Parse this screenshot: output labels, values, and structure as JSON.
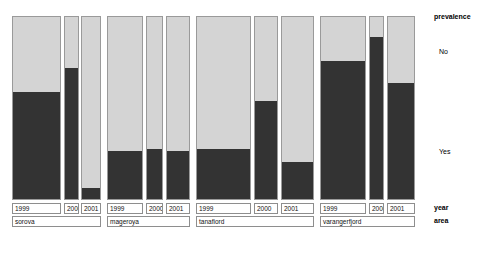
{
  "chart_data": {
    "type": "bar",
    "subtype": "stacked-mosaic",
    "title": "",
    "xlabel": "",
    "ylabel": "",
    "grid": false,
    "legend": {
      "title": "prevalence",
      "position": "right",
      "entries": [
        {
          "label": "No",
          "color": "#d4d4d4"
        },
        {
          "label": "Yes",
          "color": "#333333"
        }
      ]
    },
    "axes": [
      {
        "name": "year",
        "label": "year"
      },
      {
        "name": "area",
        "label": "area"
      }
    ],
    "categories": [
      {
        "area": "sorova",
        "year": "1999"
      },
      {
        "area": "sorova",
        "year": "2000"
      },
      {
        "area": "sorova",
        "year": "2001"
      },
      {
        "area": "mageroya",
        "year": "1999"
      },
      {
        "area": "mageroya",
        "year": "2000"
      },
      {
        "area": "mageroya",
        "year": "2001"
      },
      {
        "area": "tanafiord",
        "year": "1999"
      },
      {
        "area": "tanafiord",
        "year": "2000"
      },
      {
        "area": "tanafiord",
        "year": "2001"
      },
      {
        "area": "varangerfjord",
        "year": "1999"
      },
      {
        "area": "varangerfjord",
        "year": "2000"
      },
      {
        "area": "varangerfjord",
        "year": "2001"
      }
    ],
    "series": [
      {
        "name": "No",
        "values": [
          42,
          29,
          94,
          74,
          73,
          74,
          73,
          47,
          80,
          25,
          12,
          37
        ]
      },
      {
        "name": "Yes",
        "values": [
          58,
          71,
          6,
          26,
          27,
          26,
          27,
          53,
          20,
          75,
          88,
          63
        ]
      }
    ],
    "ylim": [
      0,
      100
    ],
    "units": "percent"
  },
  "plot": {
    "bars": [
      {
        "id": "sorova-1999",
        "x": 12,
        "w": 49,
        "yes_pct": 58,
        "area": "sorova",
        "year": "1999"
      },
      {
        "id": "sorova-2000",
        "x": 64,
        "w": 15,
        "yes_pct": 71,
        "area": "sorova",
        "year": "2000"
      },
      {
        "id": "sorova-2001",
        "x": 81,
        "w": 20,
        "yes_pct": 6,
        "area": "sorova",
        "year": "2001"
      },
      {
        "id": "mageroya-1999",
        "x": 107,
        "w": 36,
        "yes_pct": 26,
        "area": "mageroya",
        "year": "1999"
      },
      {
        "id": "mageroya-2000",
        "x": 146,
        "w": 17,
        "yes_pct": 27,
        "area": "mageroya",
        "year": "2000"
      },
      {
        "id": "mageroya-2001",
        "x": 166,
        "w": 24,
        "yes_pct": 26,
        "area": "mageroya",
        "year": "2001"
      },
      {
        "id": "tanafiord-1999",
        "x": 196,
        "w": 55,
        "yes_pct": 27,
        "area": "tanafiord",
        "year": "1999"
      },
      {
        "id": "tanafiord-2000",
        "x": 254,
        "w": 24,
        "yes_pct": 53,
        "area": "tanafiord",
        "year": "2000"
      },
      {
        "id": "tanafiord-2001",
        "x": 281,
        "w": 33,
        "yes_pct": 20,
        "area": "tanafiord",
        "year": "2001"
      },
      {
        "id": "varangerfjord-1999",
        "x": 320,
        "w": 46,
        "yes_pct": 75,
        "area": "varangerfjord",
        "year": "1999"
      },
      {
        "id": "varangerfjord-2000",
        "x": 369,
        "w": 15,
        "yes_pct": 88,
        "area": "varangerfjord",
        "year": "2000"
      },
      {
        "id": "varangerfjord-2001",
        "x": 387,
        "w": 28,
        "yes_pct": 63,
        "area": "varangerfjord",
        "year": "2001"
      }
    ],
    "year_boxes": [
      {
        "label": "1999",
        "x": 12,
        "w": 49
      },
      {
        "label": "2000",
        "x": 64,
        "w": 15
      },
      {
        "label": "2001",
        "x": 81,
        "w": 20
      },
      {
        "label": "1999",
        "x": 107,
        "w": 36
      },
      {
        "label": "2000",
        "x": 146,
        "w": 17
      },
      {
        "label": "2001",
        "x": 166,
        "w": 24
      },
      {
        "label": "1999",
        "x": 196,
        "w": 55
      },
      {
        "label": "2000",
        "x": 254,
        "w": 24
      },
      {
        "label": "2001",
        "x": 281,
        "w": 33
      },
      {
        "label": "1999",
        "x": 320,
        "w": 46
      },
      {
        "label": "2000",
        "x": 369,
        "w": 15
      },
      {
        "label": "2001",
        "x": 387,
        "w": 28
      }
    ],
    "area_boxes": [
      {
        "label": "sorova",
        "x": 12,
        "w": 89
      },
      {
        "label": "mageroya",
        "x": 107,
        "w": 83
      },
      {
        "label": "tanafiord",
        "x": 196,
        "w": 118
      },
      {
        "label": "varangerfjord",
        "x": 320,
        "w": 95
      }
    ],
    "axis_titles": {
      "year": "year",
      "area": "area"
    }
  },
  "colors": {
    "yes": "#333333",
    "no": "#d4d4d4",
    "border": "#9a9a9a",
    "background": "#ffffff",
    "text": "#111111"
  }
}
